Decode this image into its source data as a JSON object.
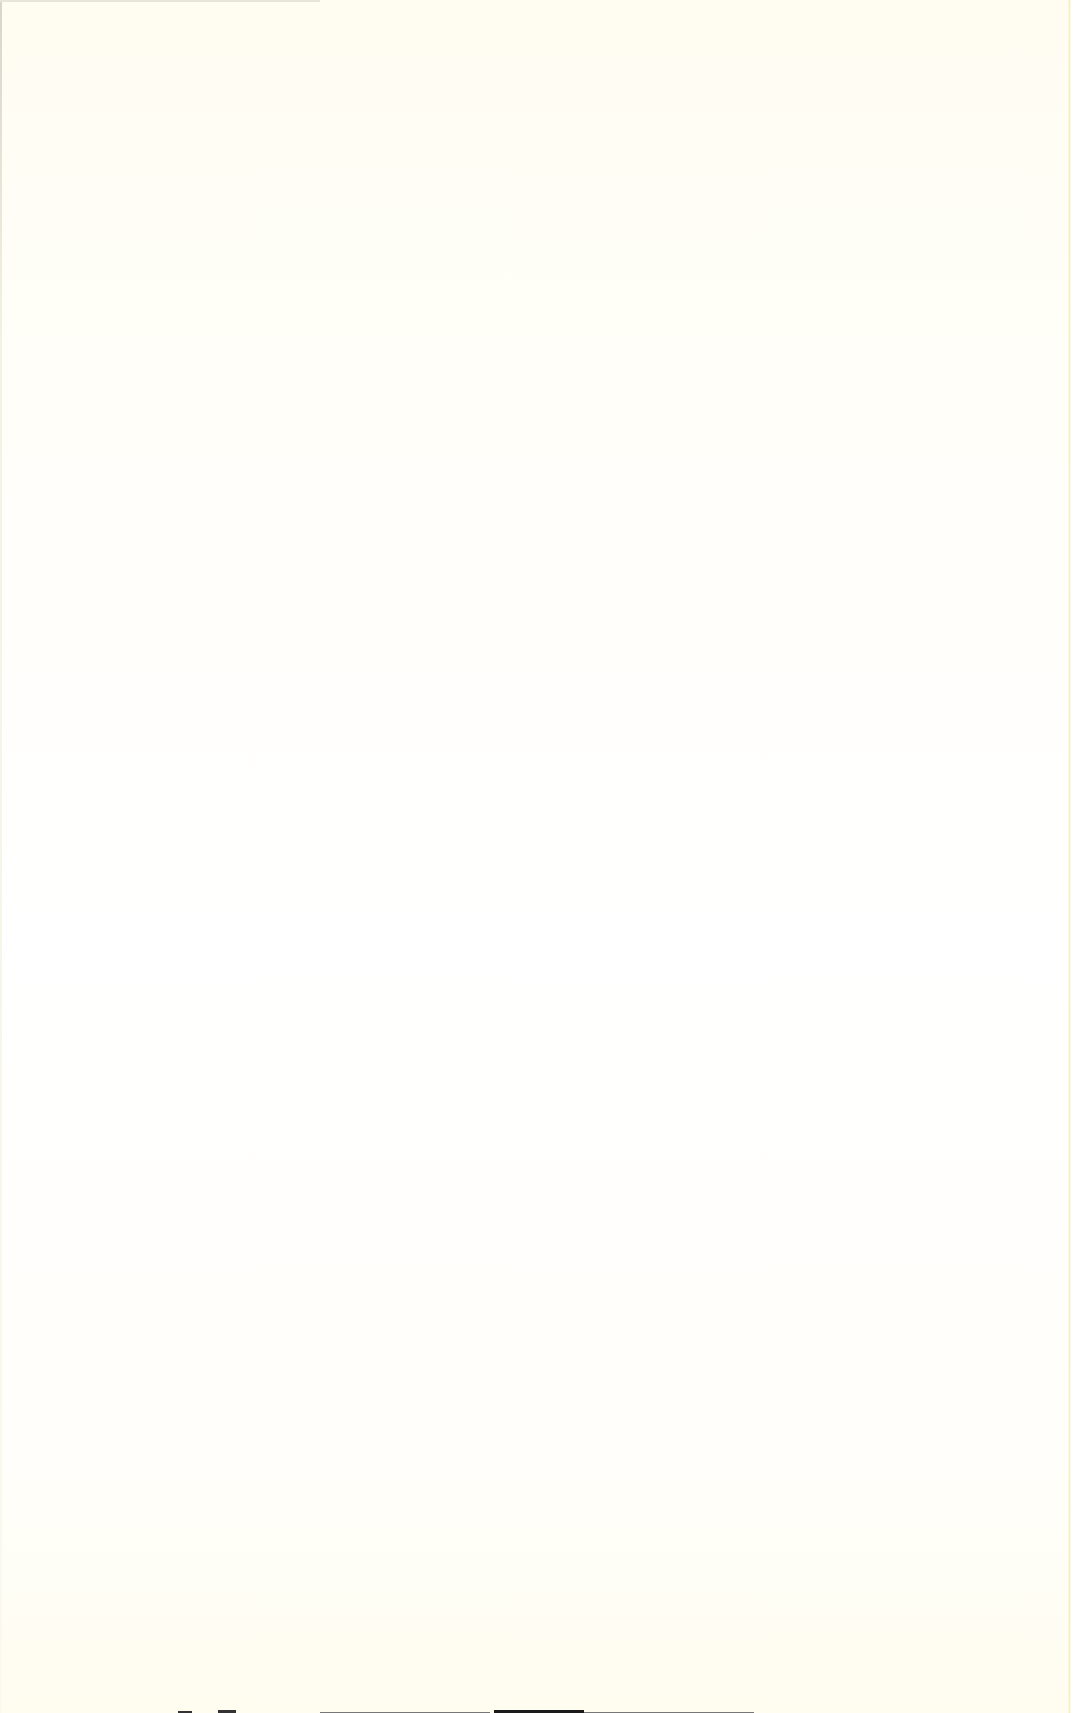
{
  "page": {
    "type": "blank-scanned-page",
    "background_color": "#fffef6",
    "text_content": ""
  }
}
